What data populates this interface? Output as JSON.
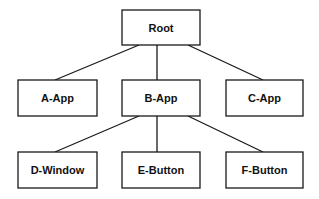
{
  "diagram": {
    "type": "tree",
    "nodes": [
      {
        "id": "root",
        "label": "Root",
        "x": 122,
        "y": 10,
        "w": 78,
        "h": 35
      },
      {
        "id": "a",
        "label": "A-App",
        "x": 18,
        "y": 80,
        "w": 79,
        "h": 36
      },
      {
        "id": "b",
        "label": "B-App",
        "x": 122,
        "y": 80,
        "w": 78,
        "h": 36
      },
      {
        "id": "c",
        "label": "C-App",
        "x": 226,
        "y": 80,
        "w": 77,
        "h": 36
      },
      {
        "id": "d",
        "label": "D-Window",
        "x": 18,
        "y": 152,
        "w": 79,
        "h": 36
      },
      {
        "id": "e",
        "label": "E-Button",
        "x": 122,
        "y": 152,
        "w": 78,
        "h": 36
      },
      {
        "id": "f",
        "label": "F-Button",
        "x": 226,
        "y": 152,
        "w": 77,
        "h": 36
      }
    ],
    "edges": [
      {
        "from": "root",
        "to": "a",
        "x1": 139,
        "y1": 45,
        "x2": 55,
        "y2": 80
      },
      {
        "from": "root",
        "to": "b",
        "x1": 157,
        "y1": 45,
        "x2": 157,
        "y2": 80
      },
      {
        "from": "root",
        "to": "c",
        "x1": 188,
        "y1": 45,
        "x2": 263,
        "y2": 80
      },
      {
        "from": "b",
        "to": "d",
        "x1": 139,
        "y1": 116,
        "x2": 55,
        "y2": 152
      },
      {
        "from": "b",
        "to": "e",
        "x1": 157,
        "y1": 116,
        "x2": 157,
        "y2": 152
      },
      {
        "from": "b",
        "to": "f",
        "x1": 188,
        "y1": 116,
        "x2": 263,
        "y2": 152
      }
    ]
  },
  "labels": {
    "root": "Root",
    "a": "A-App",
    "b": "B-App",
    "c": "C-App",
    "d": "D-Window",
    "e": "E-Button",
    "f": "F-Button"
  },
  "colors": {
    "stroke": "#1a1a1a",
    "fill": "#ffffff",
    "text": "#111111"
  }
}
